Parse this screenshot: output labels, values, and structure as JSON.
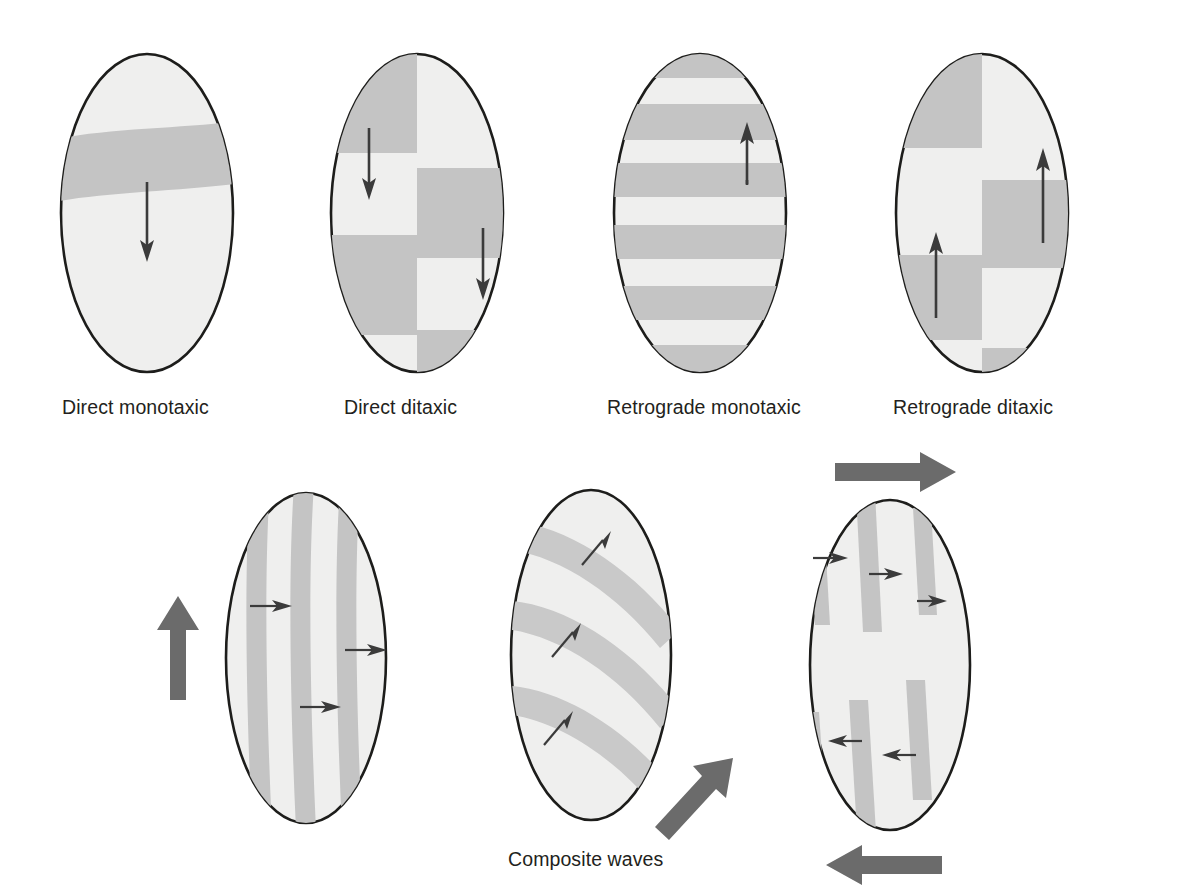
{
  "figure": {
    "background_color": "#ffffff",
    "ellipse_fill": "#efefee",
    "ellipse_stroke": "#1d1d1b",
    "band_color": "#c4c4c4",
    "thin_arrow_color": "#3b3b3b",
    "thick_arrow_color": "#6b6b6b"
  },
  "top_row": {
    "panels": [
      {
        "id": "direct-monotaxic",
        "label": "Direct monotaxic",
        "pattern": "single horizontal band",
        "band_count": 1,
        "arrow_count": 1,
        "arrow_direction": "down"
      },
      {
        "id": "direct-ditaxic",
        "label": "Direct ditaxic",
        "pattern": "offset left/right blocks",
        "band_count": 5,
        "arrow_count": 2,
        "arrow_direction": "down"
      },
      {
        "id": "retrograde-monotaxic",
        "label": "Retrograde monotaxic",
        "pattern": "multiple horizontal stripes",
        "band_count": 6,
        "arrow_count": 1,
        "arrow_direction": "up"
      },
      {
        "id": "retrograde-ditaxic",
        "label": "Retrograde ditaxic",
        "pattern": "offset left/right blocks",
        "band_count": 5,
        "arrow_count": 2,
        "arrow_direction": "up"
      }
    ]
  },
  "bottom_row": {
    "caption": "Composite waves",
    "panels": [
      {
        "id": "composite-vertical",
        "pattern": "vertical stripes",
        "band_count": 3,
        "inner_arrow_count": 3,
        "inner_arrow_direction": "right",
        "outer_arrow_direction": "up",
        "outer_arrow_position": "left"
      },
      {
        "id": "composite-oblique",
        "pattern": "oblique curved bands",
        "band_count": 3,
        "inner_arrow_count": 3,
        "inner_arrow_direction": "up-right",
        "outer_arrow_direction": "up-right",
        "outer_arrow_position": "bottom-right"
      },
      {
        "id": "composite-antidromic",
        "pattern": "vertical stripes, opposed halves",
        "band_count": 6,
        "inner_arrow_count": 6,
        "inner_arrow_direction": "right-top / left-bottom",
        "outer_arrow_direction": "right-top / left-bottom",
        "outer_arrow_position": "top and bottom"
      }
    ]
  }
}
